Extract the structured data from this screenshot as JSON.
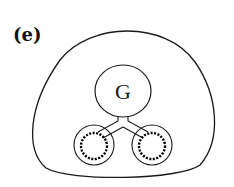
{
  "figure": {
    "panel_label": "(e)",
    "center_label": "G"
  },
  "colors": {
    "stroke": "#1a1a1a",
    "background": "#ffffff"
  }
}
